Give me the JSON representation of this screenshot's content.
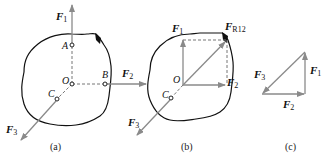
{
  "figure": {
    "panels": [
      {
        "caption": "(a)",
        "points": {
          "A": "A",
          "B": "B",
          "C": "C",
          "O": "O"
        },
        "forces": {
          "f1": {
            "main": "F",
            "sub": "1"
          },
          "f2": {
            "main": "F",
            "sub": "2"
          },
          "f3": {
            "main": "F",
            "sub": "3"
          }
        }
      },
      {
        "caption": "(b)",
        "points": {
          "C": "C",
          "O": "O"
        },
        "forces": {
          "f1": {
            "main": "F",
            "sub": "1"
          },
          "f2": {
            "main": "F",
            "sub": "2"
          },
          "f3": {
            "main": "F",
            "sub": "3"
          },
          "fr12": {
            "main": "F",
            "sub": "R12"
          }
        }
      },
      {
        "caption": "(c)",
        "forces": {
          "f1": {
            "main": "F",
            "sub": "1"
          },
          "f2": {
            "main": "F",
            "sub": "2"
          },
          "f3": {
            "main": "F",
            "sub": "3"
          }
        }
      }
    ],
    "colors": {
      "outline": "#111111",
      "vector": "#8a8a8a",
      "dashed": "#777777"
    }
  }
}
